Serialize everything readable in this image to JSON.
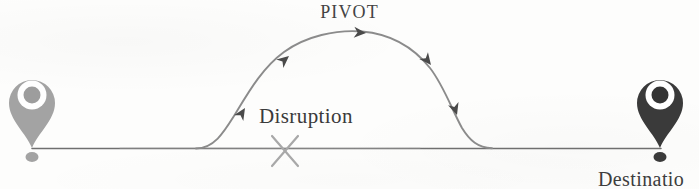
{
  "diagram": {
    "title_visible": false,
    "background_color": "#fdfdfc",
    "labels": {
      "pivot": "PIVOT",
      "disruption": "Disruption",
      "destination": "Destinatio"
    },
    "colors": {
      "origin_pin": "#a3a3a3",
      "destination_pin": "#3a3a3a",
      "baseline": "#6e6e6e",
      "arc": "#8b8b8b",
      "arrowhead": "#4a4a4a",
      "disruption_x": "#a8a8a8",
      "label_text": "#3b3b3b"
    },
    "nodes": [
      {
        "id": "origin",
        "type": "map-pin",
        "tone": "light",
        "x": 32,
        "y": 95,
        "tip_y": 148
      },
      {
        "id": "destination",
        "type": "map-pin",
        "tone": "dark",
        "x": 660,
        "y": 95,
        "tip_y": 148
      }
    ],
    "baseline": {
      "y": 148,
      "x_start": 32,
      "x_end": 661
    },
    "disruption_marker": {
      "shape": "x-cross",
      "x": 285,
      "y": 150,
      "size": 26
    },
    "arc": {
      "description": "detour path rising from baseline, peaking at PIVOT, descending back to baseline",
      "start_x": 196,
      "peak_x": 360,
      "peak_y": 31,
      "end_x": 487
    },
    "arrow_markers": [
      {
        "x": 245,
        "y": 108,
        "angle": -58
      },
      {
        "x": 288,
        "y": 57,
        "angle": -40
      },
      {
        "x": 363,
        "y": 33,
        "angle": 4
      },
      {
        "x": 430,
        "y": 63,
        "angle": 52
      },
      {
        "x": 456,
        "y": 113,
        "angle": 72
      }
    ]
  }
}
